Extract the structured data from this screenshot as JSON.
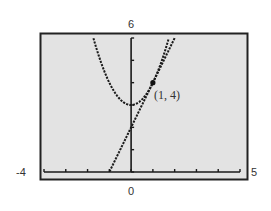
{
  "chart_data": {
    "type": "line",
    "title": "",
    "xlabel": "",
    "ylabel": "",
    "xlim": [
      -4,
      5
    ],
    "ylim": [
      0,
      6
    ],
    "grid": false,
    "legend": null,
    "xscale_ticks": [
      -4,
      -3,
      -2,
      -1,
      0,
      1,
      2,
      3,
      4,
      5
    ],
    "yscale_ticks": [
      0,
      1,
      2,
      3,
      4,
      5,
      6
    ],
    "window_labels": {
      "xmin": "-4",
      "xmax": "5",
      "ymax": "6",
      "origin": "0"
    },
    "series": [
      {
        "name": "parabola",
        "equation": "y = x^2 + 3",
        "style": "dotted",
        "x": [
          -1.73,
          -1,
          0,
          1,
          1.73
        ],
        "y": [
          6,
          4,
          3,
          4,
          6
        ]
      },
      {
        "name": "tangent line",
        "equation": "y = 2x + 2",
        "style": "dotted",
        "x": [
          -1,
          0,
          1,
          2
        ],
        "y": [
          0,
          2,
          4,
          6
        ]
      }
    ],
    "annotations": [
      {
        "text": "(1, 4)",
        "x": 1,
        "y": 4,
        "marker": "point"
      }
    ]
  },
  "labels": {
    "ymax": "6",
    "xmin": "-4",
    "xmax": "5",
    "origin": "0",
    "point": "(1, 4)"
  },
  "colors": {
    "plot_bg": "#e3e3e3",
    "frame": "#222222",
    "curve": "#1a1a1a",
    "label": "#333333"
  }
}
